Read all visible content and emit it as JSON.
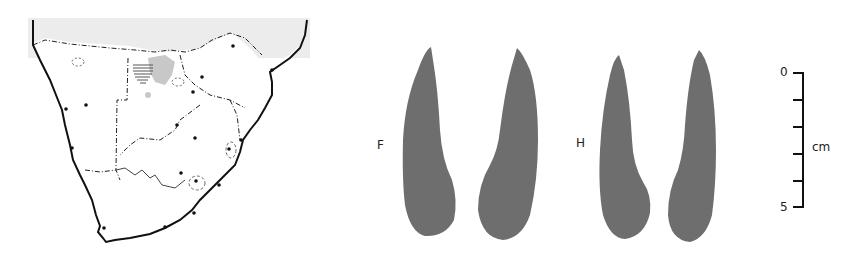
{
  "figure": {
    "map": {
      "region": "Southern Africa",
      "site_markers_count": 19,
      "legend_features": [
        "site-dot",
        "hatched-area",
        "grey-shaded-area",
        "country-borders",
        "coastline",
        "river"
      ]
    },
    "artifacts": [
      {
        "label": "F",
        "count": 2
      },
      {
        "label": "H",
        "count": 2
      }
    ],
    "scale_bar": {
      "min_label": "0",
      "max_label": "5",
      "unit": "cm",
      "ticks": 6
    },
    "colors": {
      "artifact_fill": "#6e6e6e",
      "sea": "#ececec",
      "shaded_area": "#c8c8c8",
      "line": "#111111"
    }
  }
}
